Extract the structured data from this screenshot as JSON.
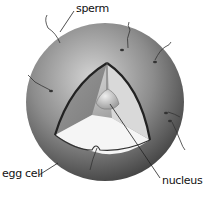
{
  "diagram": {
    "labels": {
      "sperm": "sperm",
      "egg_cell": "egg cell",
      "nucleus": "nucleus"
    },
    "colors": {
      "cell_dark": "#5a5a5a",
      "cell_light": "#c8c8c8",
      "cytoplasm_cut": "#f2f2f2",
      "nucleus": "#d0d0d0",
      "outline": "#222222"
    }
  }
}
